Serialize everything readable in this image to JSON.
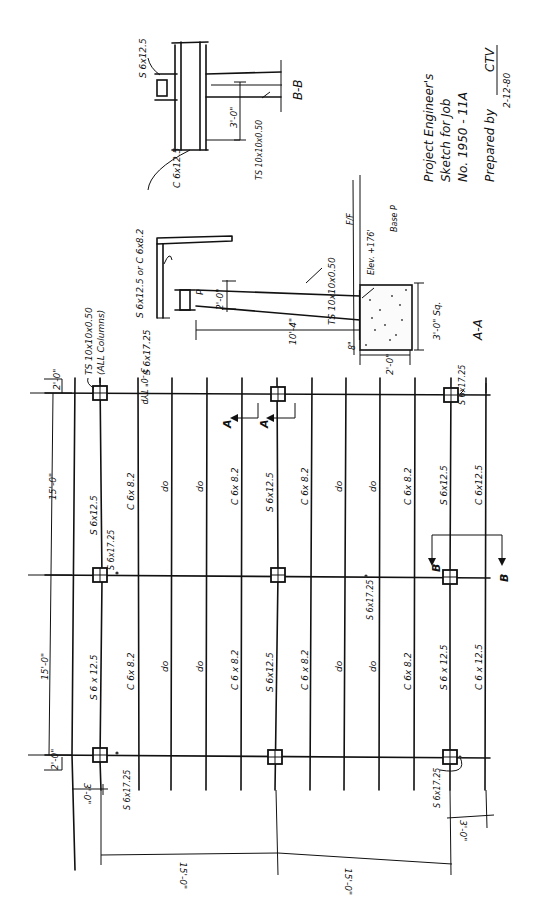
{
  "title_block": {
    "line1": "Project Engineer's",
    "line2": "Sketch for Job",
    "line3": "No. 1950 - 11A",
    "prepared_label": "Prepared by",
    "prepared_by": "CTV",
    "date": "2-12-80"
  },
  "plan": {
    "column_note_line1": "TS 10x10x0.50",
    "column_note_line2": "(ALL Columns)",
    "typ_spacing": "3'-0\" TYP",
    "dims_top": {
      "left_overhang": "2'-0\"",
      "bay1": "15'-0\"",
      "bay2": "15'-0\"",
      "right_overhang": "2'-0\""
    },
    "dims_bottom": {
      "left_overhang": "3'-0\"",
      "bay1": "15'-0\"",
      "bay2": "15'-0\"",
      "right_overhang": "3'-0\""
    },
    "members_bay1": [
      "S 6x12.5",
      "C 6x 8.2",
      "do",
      "do",
      "C 6x 8.2",
      "S 6x12.5",
      "C 6x 8.2",
      "do",
      "do",
      "C 6x 8.2",
      "S 6x12.5",
      "C 6x12.5"
    ],
    "members_bay2": [
      "S 6 x 12.5",
      "C 6x 8.2",
      "do",
      "do",
      "C 6 x 8.2",
      "S 6x12.5",
      "C 6 x 8.2",
      "do",
      "do",
      "C 6x 8.2",
      "S 6 x 12.5",
      "C 6 x 12.5"
    ],
    "girder_labels": {
      "top_left": "S 6x17.25",
      "top_mid": "S 6x17.25",
      "top_right": "S 6x17.25",
      "mid": "S 6x17.25",
      "bottom_left": "S 6x17.25",
      "bottom_right": "S 6x17.25"
    },
    "section_markers": {
      "a": "A",
      "b": "B"
    }
  },
  "section_aa": {
    "title": "A-A",
    "beam_top": "S 6x12.5 or C 6x8.2",
    "girder": "S 6x17.25",
    "plate": "P",
    "column": "TS 10x10x0.50",
    "dim_2ft": "2'-0\"",
    "dim_height": "10'-4\"",
    "dim_base": "2'-0\"",
    "dim_8in": "8\"",
    "ff_label": "F/F",
    "elev_label": "Elev. +176'",
    "base_plate": "Base P",
    "footing_size": "3'-0\" Sq."
  },
  "section_bb": {
    "title": "B-B",
    "beam": "S 6x12.5",
    "channel": "C 6x12.5",
    "column": "TS 10x10x0.50",
    "dim": "3'-0\""
  }
}
